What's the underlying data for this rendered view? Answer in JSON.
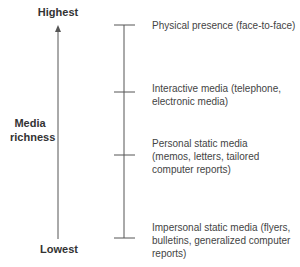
{
  "diagram": {
    "axis": {
      "top_label": "Highest",
      "middle_label_line1": "Media",
      "middle_label_line2": "richness",
      "bottom_label": "Lowest"
    },
    "levels": [
      {
        "label": "Physical presence (face-to-face)"
      },
      {
        "label": "Interactive media (telephone, electronic media)"
      },
      {
        "label": "Personal static media (memos, letters, tailored computer reports)"
      },
      {
        "label": "Impersonal static media (flyers, bulletins, generalized computer reports)"
      }
    ],
    "colors": {
      "line": "#555555",
      "text": "#444444"
    }
  }
}
